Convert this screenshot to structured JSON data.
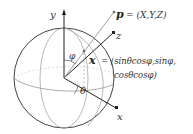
{
  "figure": {
    "axes": {
      "y_label": "y",
      "z_label": "z",
      "x_label": "x"
    },
    "angles": {
      "phi": "φ",
      "theta": "θ"
    },
    "point": {
      "label": "p",
      "equation": "= (X,Y,Z)"
    },
    "direction": {
      "label": "x",
      "equation_line1": "= (sinθcosφ,sinφ,",
      "equation_line2": "cosθcosφ)"
    },
    "colors": {
      "sphere_outline": "#444444",
      "meridians": "#999999",
      "axes": "#222222",
      "ray": "#888888",
      "text": "#333333"
    }
  }
}
